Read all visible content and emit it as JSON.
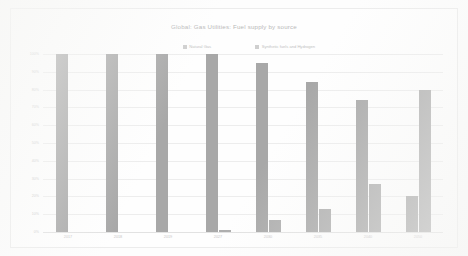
{
  "chart_data": {
    "type": "bar",
    "title": "Global: Gas Utilities: Fuel supply by source",
    "xlabel": "",
    "ylabel": "",
    "ylim": [
      0,
      100
    ],
    "grid": true,
    "legend_position": "top-center",
    "categories": [
      "2017",
      "2018",
      "2019",
      "2027",
      "2030",
      "2035",
      "2040",
      "2050"
    ],
    "ytick_labels": [
      "100%",
      "90%",
      "80%",
      "70%",
      "60%",
      "50%",
      "40%",
      "30%",
      "20%",
      "10%",
      "0%"
    ],
    "ytick_values": [
      100,
      90,
      80,
      70,
      60,
      50,
      40,
      30,
      20,
      10,
      0
    ],
    "series": [
      {
        "name": "Natural Gas",
        "color": "#a8a8a8",
        "values": [
          100,
          100,
          100,
          100,
          95,
          84,
          74,
          20
        ]
      },
      {
        "name": "Synthetic fuels and Hydrogen",
        "color": "#aeaeae",
        "values": [
          0,
          0,
          0,
          1,
          7,
          13,
          27,
          80
        ]
      }
    ]
  }
}
